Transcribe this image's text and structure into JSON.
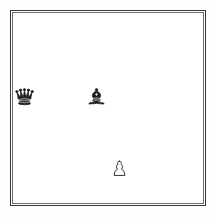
{
  "diagram": {
    "type": "chessboard",
    "files": [
      "a",
      "b",
      "c",
      "d",
      "e",
      "f",
      "g",
      "h"
    ],
    "ranks": [
      "8",
      "7",
      "6",
      "5",
      "4",
      "3",
      "2",
      "1"
    ],
    "board_size": 8,
    "orientation": "white-bottom",
    "colors": {
      "light_square": "#ffffff",
      "dark_square": "#7d7d7d",
      "frame": "#3a3a3a",
      "inner_frame": "#6e6e6e",
      "black_piece": "#1a1a1a",
      "white_piece_fill": "#ffffff",
      "white_piece_outline": "#1a1a1a",
      "page_background": "#fefefe"
    },
    "top_left_square_color": "light",
    "pieces": [
      {
        "id": "black-queen-a5",
        "piece": "queen",
        "color": "black",
        "glyph": "black-queen-icon",
        "file": "a",
        "rank": "5",
        "square": "a5",
        "square_color": "dark",
        "col_index": 0,
        "row_index": 3
      },
      {
        "id": "black-bishop-d5",
        "piece": "bishop",
        "color": "black",
        "glyph": "black-bishop-icon",
        "file": "d",
        "rank": "5",
        "square": "d5",
        "square_color": "light",
        "col_index": 3,
        "row_index": 3
      },
      {
        "id": "white-pawn-e2",
        "piece": "pawn",
        "color": "white",
        "glyph": "white-pawn-icon",
        "file": "e",
        "rank": "2",
        "square": "e2",
        "square_color": "light",
        "col_index": 4,
        "row_index": 6
      }
    ],
    "fen": "8/8/8/q2b4/8/8/4P3/8",
    "material": {
      "black": [
        "queen",
        "bishop"
      ],
      "white": [
        "pawn"
      ]
    }
  }
}
